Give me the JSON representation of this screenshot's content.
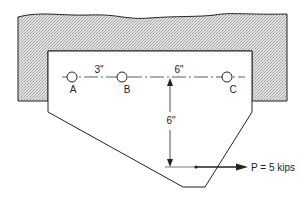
{
  "diagram": {
    "type": "bracket-connection-eccentric-load",
    "support": {
      "fill": "#d4d4d4",
      "stroke": "#222222"
    },
    "plate": {
      "fill": "#ffffff",
      "stroke": "#222222"
    },
    "bolts": [
      {
        "id": "A",
        "label": "A"
      },
      {
        "id": "B",
        "label": "B"
      },
      {
        "id": "C",
        "label": "C"
      }
    ],
    "dimensions": {
      "ab_spacing": "3\"",
      "bc_to_load": "6\"",
      "vertical": "6\""
    },
    "load": {
      "label": "P = 5 kips"
    }
  }
}
